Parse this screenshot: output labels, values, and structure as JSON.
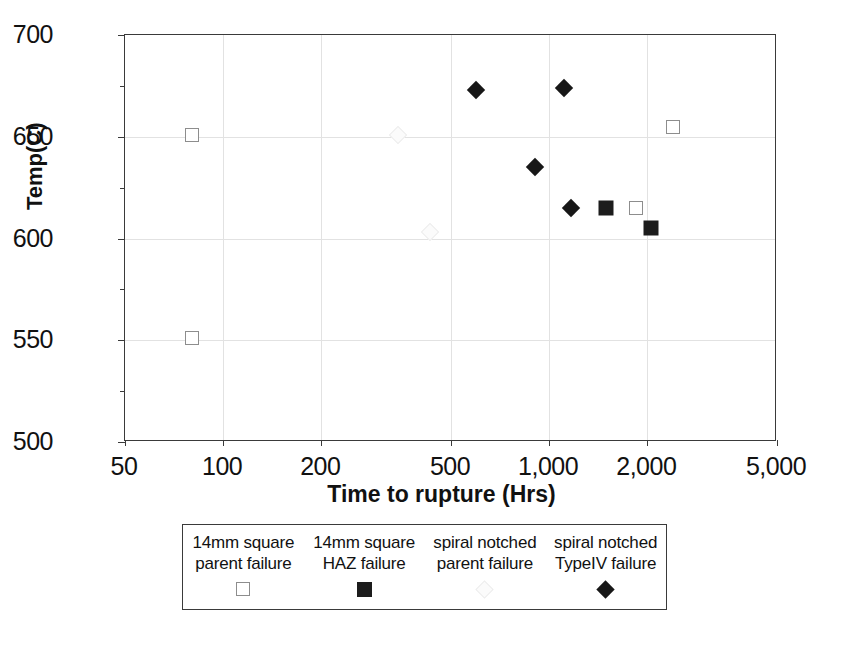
{
  "chart_data": {
    "type": "scatter",
    "title": "",
    "xlabel": "Time to rupture (Hrs)",
    "ylabel": "Temp(C)",
    "xscale": "log",
    "yscale": "linear",
    "xlim": [
      50,
      5000
    ],
    "ylim": [
      500,
      700
    ],
    "xticks": [
      50,
      100,
      200,
      500,
      1000,
      2000,
      5000
    ],
    "xticklabels": [
      "50",
      "100",
      "200",
      "500",
      "1,000",
      "2,000",
      "5,000"
    ],
    "yticks": [
      500,
      550,
      600,
      650,
      700
    ],
    "yticklabels": [
      "500",
      "550",
      "600",
      "650",
      "700"
    ],
    "yminorticks": [
      525,
      575,
      625,
      675
    ],
    "grid": true,
    "legend_position": "below-axes",
    "series": [
      {
        "name": "14mm square parent failure",
        "marker": "open-square",
        "color": "#8d8d8d",
        "points": [
          {
            "x": 80,
            "y": 651
          },
          {
            "x": 80,
            "y": 551
          },
          {
            "x": 2400,
            "y": 655
          },
          {
            "x": 1850,
            "y": 615
          }
        ]
      },
      {
        "name": "14mm square HAZ failure",
        "marker": "filled-square",
        "color": "#1c1c1c",
        "points": [
          {
            "x": 1490,
            "y": 615
          },
          {
            "x": 2060,
            "y": 605
          }
        ]
      },
      {
        "name": "spiral notched parent failure",
        "marker": "open-diamond",
        "color": "#ededed",
        "points": [
          {
            "x": 345,
            "y": 651
          },
          {
            "x": 430,
            "y": 603
          }
        ]
      },
      {
        "name": "spiral notched TypeIV failure",
        "marker": "filled-diamond",
        "color": "#171717",
        "points": [
          {
            "x": 595,
            "y": 673
          },
          {
            "x": 1110,
            "y": 674
          },
          {
            "x": 905,
            "y": 635
          },
          {
            "x": 1165,
            "y": 615
          }
        ]
      }
    ]
  },
  "legend": {
    "entries": [
      {
        "line1": "14mm square",
        "line2": "parent failure",
        "marker": "open-square"
      },
      {
        "line1": "14mm square",
        "line2": "HAZ failure",
        "marker": "filled-square"
      },
      {
        "line1": "spiral notched",
        "line2": "parent failure",
        "marker": "open-diamond"
      },
      {
        "line1": "spiral notched",
        "line2": "TypeIV failure",
        "marker": "filled-diamond"
      }
    ]
  }
}
